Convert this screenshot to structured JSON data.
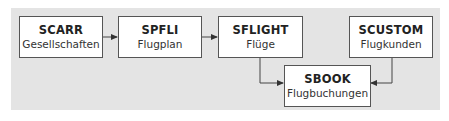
{
  "diagram": {
    "background_color": "#e4e4e4",
    "nodes": [
      {
        "id": "scarr",
        "title": "SCARR",
        "subtitle": "Gesellschaften"
      },
      {
        "id": "spfli",
        "title": "SPFLI",
        "subtitle": "Flugplan"
      },
      {
        "id": "sflight",
        "title": "SFLIGHT",
        "subtitle": "Flüge"
      },
      {
        "id": "scustom",
        "title": "SCUSTOM",
        "subtitle": "Flugkunden"
      },
      {
        "id": "sbook",
        "title": "SBOOK",
        "subtitle": "Flugbuchungen"
      }
    ],
    "edges": [
      {
        "from": "scarr",
        "to": "spfli"
      },
      {
        "from": "spfli",
        "to": "sflight"
      },
      {
        "from": "sflight",
        "to": "sbook"
      },
      {
        "from": "scustom",
        "to": "sbook"
      }
    ]
  }
}
